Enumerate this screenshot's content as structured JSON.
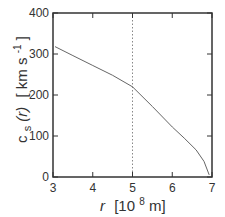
{
  "chart_data": {
    "type": "line",
    "title": "",
    "xlabel": "r  [10^8 m]",
    "ylabel": "c_s(r)  [km s^-1]",
    "xlim": [
      3,
      7
    ],
    "ylim": [
      0,
      400
    ],
    "xticks": [
      3,
      4,
      5,
      6,
      7
    ],
    "yticks": [
      0,
      100,
      200,
      300,
      400
    ],
    "grid": false,
    "legend": null,
    "annotations": [
      {
        "type": "vertical_dotted_line",
        "x": 5
      }
    ],
    "series": [
      {
        "name": "c_s(r)",
        "x": [
          3.05,
          3.5,
          4.0,
          4.5,
          5.0,
          5.5,
          6.0,
          6.3,
          6.6,
          6.8,
          6.93
        ],
        "values": [
          318,
          296,
          272,
          248,
          220,
          172,
          122,
          95,
          66,
          38,
          5
        ]
      }
    ]
  },
  "labels": {
    "x_ticks": [
      "3",
      "4",
      "5",
      "6",
      "7"
    ],
    "y_ticks": [
      "0",
      "100",
      "200",
      "300",
      "400"
    ],
    "x_axis": {
      "var": "r",
      "unit_pre": "[10",
      "unit_exp": "8",
      "unit_post": " m]"
    },
    "y_axis": {
      "var": "c",
      "sub": "s",
      "arg": "(r)",
      "unit_pre": "[ km s",
      "unit_exp": "-1",
      "unit_post": "]"
    }
  },
  "colors": {
    "frame": "#333333",
    "curve": "#666666",
    "dotted": "#888888"
  }
}
